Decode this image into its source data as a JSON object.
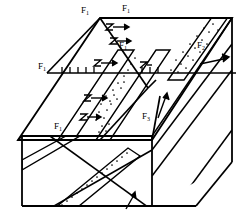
{
  "figure": {
    "type": "geologic-block-diagram",
    "background_color": "#ffffff",
    "line_color": "#000000",
    "stipple_color": "#000000"
  },
  "labels": [
    {
      "id": "f1-top-left",
      "text": "F",
      "sub": "1",
      "x": 81,
      "y": 6
    },
    {
      "id": "f1-top-right",
      "text": "F",
      "sub": "1",
      "x": 122,
      "y": 4
    },
    {
      "id": "f1-mid",
      "text": "F",
      "sub": "1",
      "x": 119,
      "y": 41
    },
    {
      "id": "f1-left",
      "text": "F",
      "sub": "1",
      "x": 38,
      "y": 62
    },
    {
      "id": "f2-right",
      "text": "F",
      "sub": "2",
      "x": 197,
      "y": 41
    },
    {
      "id": "f3-center",
      "text": "F",
      "sub": "3",
      "x": 142,
      "y": 112
    },
    {
      "id": "f1-lower-left",
      "text": "F",
      "sub": "1",
      "x": 54,
      "y": 122
    }
  ],
  "annotations": {
    "fault_traces": [
      "F1",
      "F2",
      "F3"
    ],
    "hachure_symbol": "normal-fault-ticks",
    "slip_symbol": "z-shaped-offset-arrow",
    "marker_bed_pattern": "stippled"
  },
  "geometry": {
    "block_outline": "M18,140 L100,18 L232,18 L232,162 L196,206 L22,206 Z",
    "top_surface": "M18,140 L100,18 L232,18 L152,140 Z",
    "front_face": "M22,206 L22,136 L152,136 L152,206 Z",
    "right_face": "M152,206 L152,136 L232,18 L232,162 Z"
  }
}
